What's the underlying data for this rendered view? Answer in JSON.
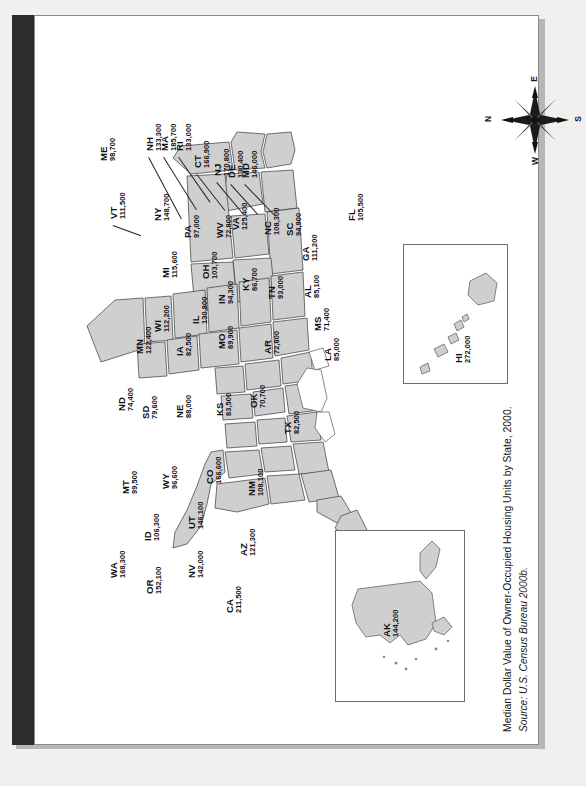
{
  "sidebar": {
    "title": "U. S. DATA MAP 12.1"
  },
  "caption": {
    "main": "Median Dollar Value of Owner-Occupied Housing Units by State, 2000.",
    "source": "Source: U.S. Census Bureau 2000b."
  },
  "compass": {
    "name": "compass-rose",
    "north": "N",
    "east": "E",
    "south": "S",
    "west": "W"
  },
  "insets": {
    "hawaii": {
      "abbr": "HI",
      "value": "272,000"
    },
    "alaska": {
      "abbr": "AK",
      "value": "144,200"
    }
  },
  "chart_data": {
    "type": "map",
    "title": "Median Dollar Value of Owner-Occupied Housing Units by State, 2000.",
    "subtitle": "Source: U.S. Census Bureau 2000b.",
    "unit": "US dollars",
    "xlabel": "",
    "ylabel": "",
    "legend": "none",
    "grid": false,
    "categories": [
      "ME",
      "NH",
      "MA",
      "RI",
      "CT",
      "NJ",
      "DE",
      "MD",
      "VT",
      "NY",
      "PA",
      "WV",
      "VA",
      "NC",
      "SC",
      "GA",
      "FL",
      "AL",
      "MS",
      "LA",
      "TN",
      "KY",
      "OH",
      "IN",
      "MI",
      "IL",
      "WI",
      "MN",
      "IA",
      "MO",
      "AR",
      "ND",
      "SD",
      "NE",
      "KS",
      "OK",
      "TX",
      "MT",
      "WY",
      "CO",
      "NM",
      "ID",
      "UT",
      "AZ",
      "NV",
      "CA",
      "OR",
      "WA",
      "HI",
      "AK"
    ],
    "values": [
      98700,
      133300,
      185700,
      133000,
      166900,
      170800,
      130400,
      146000,
      111500,
      148700,
      97000,
      72800,
      125400,
      108300,
      94900,
      111200,
      105500,
      85100,
      71400,
      85000,
      93000,
      86700,
      103700,
      94300,
      115600,
      130800,
      112200,
      122400,
      82500,
      89900,
      72800,
      74400,
      79600,
      88000,
      83500,
      70700,
      82500,
      99500,
      96600,
      166600,
      108100,
      106300,
      146100,
      121300,
      142000,
      211500,
      152100,
      168300,
      272000,
      144200
    ],
    "states": [
      {
        "abbr": "ME",
        "value": "98,700",
        "callout": true,
        "x": 64,
        "y": 145,
        "lx": 86,
        "ly": 145,
        "leaderLen": 0,
        "leaderRot": 0
      },
      {
        "abbr": "NH",
        "value": "133,300",
        "callout": true,
        "x": 110,
        "y": 135,
        "lx": 0,
        "ly": 0,
        "leaderLen": 70,
        "leaderRot": 62
      },
      {
        "abbr": "MA",
        "value": "185,700",
        "callout": true,
        "x": 125,
        "y": 135,
        "lx": 0,
        "ly": 0,
        "leaderLen": 62,
        "leaderRot": 58
      },
      {
        "abbr": "RI",
        "value": "133,000",
        "callout": true,
        "x": 140,
        "y": 135,
        "lx": 0,
        "ly": 0,
        "leaderLen": 55,
        "leaderRot": 55
      },
      {
        "abbr": "CT",
        "value": "166,900",
        "callout": true,
        "x": 158,
        "y": 152,
        "lx": 0,
        "ly": 0,
        "leaderLen": 46,
        "leaderRot": 52
      },
      {
        "abbr": "NJ",
        "value": "170,800",
        "callout": true,
        "x": 178,
        "y": 160,
        "lx": 0,
        "ly": 0,
        "leaderLen": 42,
        "leaderRot": 50
      },
      {
        "abbr": "DE",
        "value": "130,400",
        "callout": true,
        "x": 192,
        "y": 162,
        "lx": 0,
        "ly": 0,
        "leaderLen": 40,
        "leaderRot": 48
      },
      {
        "abbr": "MD",
        "value": "146,000",
        "callout": true,
        "x": 206,
        "y": 162,
        "lx": 0,
        "ly": 0,
        "leaderLen": 44,
        "leaderRot": 46
      },
      {
        "abbr": "VT",
        "value": "111,500",
        "callout": true,
        "x": 74,
        "y": 203,
        "lx": 0,
        "ly": 0,
        "leaderLen": 30,
        "leaderRot": 20
      },
      {
        "abbr": "NY",
        "value": "148,700",
        "callout": false,
        "x": 118,
        "y": 205
      },
      {
        "abbr": "PA",
        "value": "97,000",
        "callout": false,
        "x": 148,
        "y": 222
      },
      {
        "abbr": "WV",
        "value": "72,800",
        "callout": false,
        "x": 180,
        "y": 222
      },
      {
        "abbr": "VA",
        "value": "125,400",
        "callout": false,
        "x": 196,
        "y": 214
      },
      {
        "abbr": "NC",
        "value": "108,300",
        "callout": false,
        "x": 228,
        "y": 219
      },
      {
        "abbr": "SC",
        "value": "94,900",
        "callout": false,
        "x": 250,
        "y": 220
      },
      {
        "abbr": "GA",
        "value": "111,200",
        "callout": false,
        "x": 266,
        "y": 245
      },
      {
        "abbr": "FL",
        "value": "105,500",
        "callout": false,
        "x": 312,
        "y": 205
      },
      {
        "abbr": "AL",
        "value": "85,100",
        "callout": false,
        "x": 268,
        "y": 282
      },
      {
        "abbr": "MS",
        "value": "71,400",
        "callout": false,
        "x": 278,
        "y": 315
      },
      {
        "abbr": "LA",
        "value": "85,000",
        "callout": false,
        "x": 288,
        "y": 345
      },
      {
        "abbr": "TN",
        "value": "93,000",
        "callout": false,
        "x": 232,
        "y": 283
      },
      {
        "abbr": "KY",
        "value": "86,700",
        "callout": false,
        "x": 206,
        "y": 275
      },
      {
        "abbr": "OH",
        "value": "103,700",
        "callout": false,
        "x": 166,
        "y": 263
      },
      {
        "abbr": "IN",
        "value": "94,300",
        "callout": false,
        "x": 182,
        "y": 288
      },
      {
        "abbr": "MI",
        "value": "115,600",
        "callout": false,
        "x": 126,
        "y": 262
      },
      {
        "abbr": "IL",
        "value": "130,800",
        "callout": false,
        "x": 156,
        "y": 308
      },
      {
        "abbr": "WI",
        "value": "112,200",
        "callout": false,
        "x": 118,
        "y": 316
      },
      {
        "abbr": "MN",
        "value": "122,400",
        "callout": false,
        "x": 100,
        "y": 338
      },
      {
        "abbr": "IA",
        "value": "82,500",
        "callout": false,
        "x": 140,
        "y": 340
      },
      {
        "abbr": "MO",
        "value": "89,900",
        "callout": false,
        "x": 182,
        "y": 333
      },
      {
        "abbr": "AR",
        "value": "72,800",
        "callout": false,
        "x": 228,
        "y": 338
      },
      {
        "abbr": "ND",
        "value": "74,400",
        "callout": false,
        "x": 82,
        "y": 395
      },
      {
        "abbr": "SD",
        "value": "79,600",
        "callout": false,
        "x": 106,
        "y": 403
      },
      {
        "abbr": "NE",
        "value": "88,000",
        "callout": false,
        "x": 140,
        "y": 402
      },
      {
        "abbr": "KS",
        "value": "83,500",
        "callout": false,
        "x": 180,
        "y": 400
      },
      {
        "abbr": "OK",
        "value": "70,700",
        "callout": false,
        "x": 214,
        "y": 392
      },
      {
        "abbr": "TX",
        "value": "82,500",
        "callout": false,
        "x": 248,
        "y": 418
      },
      {
        "abbr": "MT",
        "value": "99,500",
        "callout": false,
        "x": 86,
        "y": 478
      },
      {
        "abbr": "WY",
        "value": "96,600",
        "callout": false,
        "x": 126,
        "y": 473
      },
      {
        "abbr": "CO",
        "value": "166,600",
        "callout": false,
        "x": 170,
        "y": 468
      },
      {
        "abbr": "NM",
        "value": "108,100",
        "callout": false,
        "x": 212,
        "y": 480
      },
      {
        "abbr": "ID",
        "value": "106,300",
        "callout": false,
        "x": 108,
        "y": 525
      },
      {
        "abbr": "UT",
        "value": "146,100",
        "callout": false,
        "x": 152,
        "y": 513
      },
      {
        "abbr": "AZ",
        "value": "121,300",
        "callout": false,
        "x": 204,
        "y": 540
      },
      {
        "abbr": "NV",
        "value": "142,000",
        "callout": false,
        "x": 152,
        "y": 562
      },
      {
        "abbr": "CA",
        "value": "211,500",
        "callout": false,
        "x": 190,
        "y": 597
      },
      {
        "abbr": "OR",
        "value": "152,100",
        "callout": false,
        "x": 110,
        "y": 578
      },
      {
        "abbr": "WA",
        "value": "168,300",
        "callout": false,
        "x": 74,
        "y": 562
      }
    ]
  }
}
